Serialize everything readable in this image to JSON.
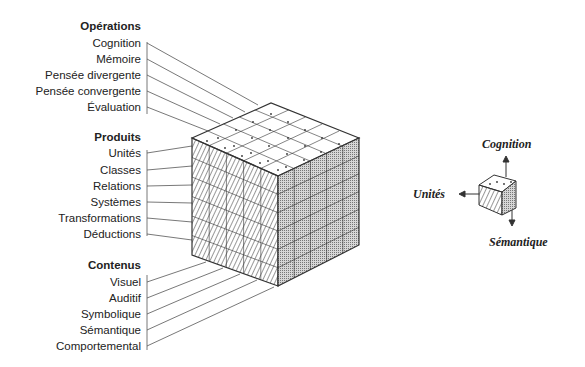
{
  "diagram": {
    "type": "structure-of-intellect-cube",
    "groups": [
      {
        "title": "Opérations",
        "items": [
          "Cognition",
          "Mémoire",
          "Pensée divergente",
          "Pensée convergente",
          "Évaluation"
        ]
      },
      {
        "title": "Produits",
        "items": [
          "Unités",
          "Classes",
          "Relations",
          "Systèmes",
          "Transformations",
          "Déductions"
        ]
      },
      {
        "title": "Contenus",
        "items": [
          "Visuel",
          "Auditif",
          "Symbolique",
          "Sémantique",
          "Comportemental"
        ]
      }
    ],
    "legend": {
      "up": "Cognition",
      "left": "Unités",
      "down": "Sémantique"
    },
    "colors": {
      "line": "#333333",
      "shade": "#bdbdbd"
    }
  }
}
